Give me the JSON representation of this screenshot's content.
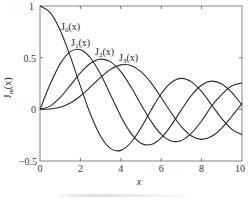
{
  "chart_data": {
    "type": "line",
    "title": "",
    "xlabel": "x",
    "ylabel": "Jm(x)",
    "xlim": [
      0,
      10
    ],
    "ylim": [
      -0.5,
      1
    ],
    "grid": false,
    "legend": "inline labels near curve peaks",
    "x_ticks": [
      "0",
      "2",
      "4",
      "6",
      "8",
      "10"
    ],
    "y_ticks": [
      "−0.5",
      "0",
      "0.5",
      "1"
    ],
    "x": [
      0,
      0.5,
      1,
      1.5,
      2,
      2.5,
      3,
      3.5,
      4,
      4.5,
      5,
      5.5,
      6,
      6.5,
      7,
      7.5,
      8,
      8.5,
      9,
      9.5,
      10
    ],
    "series": [
      {
        "name": "J0(x)",
        "values": [
          1.0,
          0.938,
          0.765,
          0.512,
          0.224,
          -0.048,
          -0.26,
          -0.38,
          -0.397,
          -0.321,
          -0.178,
          -0.007,
          0.151,
          0.26,
          0.3,
          0.266,
          0.172,
          0.042,
          -0.09,
          -0.194,
          -0.246
        ]
      },
      {
        "name": "J1(x)",
        "values": [
          0.0,
          0.242,
          0.44,
          0.558,
          0.577,
          0.497,
          0.339,
          0.137,
          -0.066,
          -0.231,
          -0.328,
          -0.341,
          -0.277,
          -0.154,
          -0.005,
          0.135,
          0.235,
          0.273,
          0.245,
          0.161,
          0.043
        ]
      },
      {
        "name": "J2(x)",
        "values": [
          0.0,
          0.031,
          0.115,
          0.232,
          0.353,
          0.446,
          0.486,
          0.459,
          0.364,
          0.218,
          0.047,
          -0.117,
          -0.243,
          -0.307,
          -0.301,
          -0.23,
          -0.113,
          0.032,
          0.145,
          0.228,
          0.255
        ]
      },
      {
        "name": "J3(x)",
        "values": [
          0.0,
          0.003,
          0.02,
          0.061,
          0.129,
          0.217,
          0.309,
          0.387,
          0.43,
          0.425,
          0.365,
          0.256,
          0.115,
          -0.035,
          -0.168,
          -0.258,
          -0.291,
          -0.261,
          -0.181,
          -0.067,
          0.058
        ]
      }
    ],
    "annotations": [
      {
        "text": "J0(x)",
        "x": 1.1,
        "y": 0.79
      },
      {
        "text": "J1(x)",
        "x": 1.6,
        "y": 0.64
      },
      {
        "text": "J2(x)",
        "x": 2.8,
        "y": 0.55
      },
      {
        "text": "J3(x)",
        "x": 4.0,
        "y": 0.49
      }
    ]
  },
  "labels": {
    "xlabel": "x",
    "ylabel_main": "J",
    "ylabel_sub": "m",
    "ylabel_arg": "(x)",
    "x_ticks": [
      "0",
      "2",
      "4",
      "6",
      "8",
      "10"
    ],
    "y_ticks": [
      "1",
      "0.5",
      "0",
      "−0.5"
    ],
    "curves": [
      {
        "main": "J",
        "sub": "0",
        "arg": "(x)"
      },
      {
        "main": "J",
        "sub": "1",
        "arg": "(x)"
      },
      {
        "main": "J",
        "sub": "2",
        "arg": "(x)"
      },
      {
        "main": "J",
        "sub": "3",
        "arg": "(x)"
      }
    ]
  },
  "colors": {
    "line": "#2a2a2a",
    "axis": "#555555"
  }
}
